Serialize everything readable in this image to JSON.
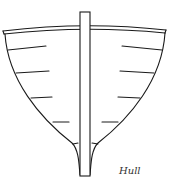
{
  "figure": {
    "label": "Hull",
    "colors": {
      "stroke": "#1a1a1a",
      "background": "#ffffff"
    },
    "parts": [
      "gunwale",
      "hull-outline",
      "keel-post",
      "ribs"
    ]
  }
}
